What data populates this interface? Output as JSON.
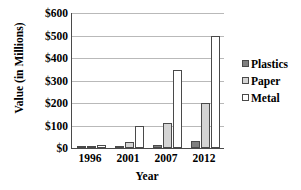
{
  "chart_data": {
    "type": "bar",
    "title": "",
    "xlabel": "Year",
    "ylabel": "Value (in Millions)",
    "categories": [
      "1996",
      "2001",
      "2007",
      "2012"
    ],
    "series": [
      {
        "name": "Plastics",
        "color": "#808080",
        "values": [
          5,
          8,
          15,
          30
        ]
      },
      {
        "name": "Paper",
        "color": "#d4d4d4",
        "values": [
          8,
          25,
          110,
          200
        ]
      },
      {
        "name": "Metal",
        "color": "#ffffff",
        "values": [
          15,
          100,
          348,
          498
        ]
      }
    ],
    "ylim": [
      0,
      600
    ],
    "ytick_step": 100,
    "ytick_labels": [
      "$600",
      "$500",
      "$400",
      "$300",
      "$200",
      "$100",
      "$0"
    ],
    "ytick_values": [
      600,
      500,
      400,
      300,
      200,
      100,
      0
    ],
    "grid": true,
    "grid_axis": "y",
    "legend_position": "right",
    "legend_entries": [
      "Plastics",
      "Paper",
      "Metal"
    ]
  }
}
